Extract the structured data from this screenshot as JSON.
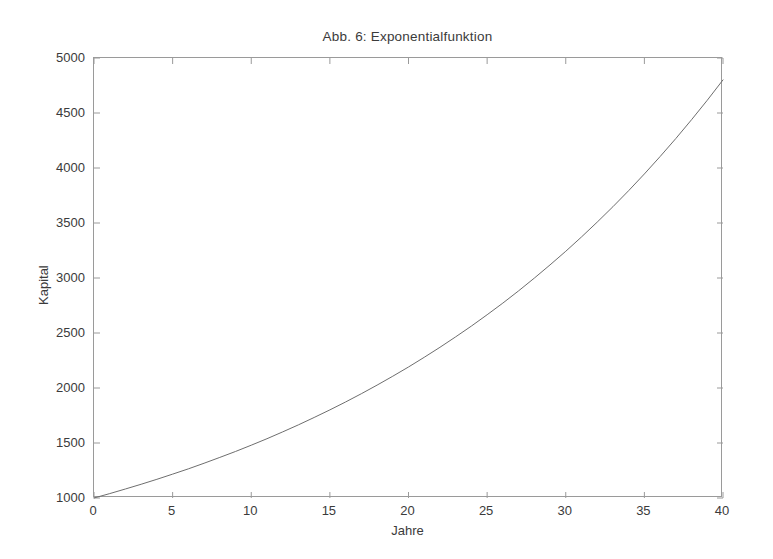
{
  "chart_data": {
    "type": "line",
    "title": "Abb. 6: Exponentialfunktion",
    "xlabel": "Jahre",
    "ylabel": "Kapital",
    "xlim": [
      0,
      40
    ],
    "ylim": [
      1000,
      5000
    ],
    "xticks": [
      0,
      5,
      10,
      15,
      20,
      25,
      30,
      35,
      40
    ],
    "xtick_labels": [
      "0",
      "5",
      "10",
      "15",
      "20",
      "25",
      "30",
      "35",
      "40"
    ],
    "yticks": [
      1000,
      1500,
      2000,
      2500,
      3000,
      3500,
      4000,
      4500,
      5000
    ],
    "ytick_labels": [
      "1000",
      "1500",
      "2000",
      "2500",
      "3000",
      "3500",
      "4000",
      "4500",
      "5000"
    ],
    "grid": false,
    "legend": null,
    "line_color": "#6e6e6e",
    "axis_color": "#9a9a9a",
    "series": [
      {
        "name": "Kapital",
        "formula": "1000 * 1.04^t",
        "x": [
          0,
          1,
          2,
          3,
          4,
          5,
          6,
          7,
          8,
          9,
          10,
          11,
          12,
          13,
          14,
          15,
          16,
          17,
          18,
          19,
          20,
          21,
          22,
          23,
          24,
          25,
          26,
          27,
          28,
          29,
          30,
          31,
          32,
          33,
          34,
          35,
          36,
          37,
          38,
          39,
          40
        ],
        "values": [
          1000,
          1040,
          1082,
          1125,
          1170,
          1217,
          1265,
          1316,
          1369,
          1423,
          1480,
          1539,
          1601,
          1665,
          1732,
          1801,
          1873,
          1948,
          2026,
          2107,
          2191,
          2279,
          2370,
          2465,
          2563,
          2666,
          2772,
          2883,
          2999,
          3119,
          3243,
          3373,
          3508,
          3648,
          3794,
          3946,
          4104,
          4268,
          4439,
          4616,
          4801
        ]
      }
    ]
  }
}
